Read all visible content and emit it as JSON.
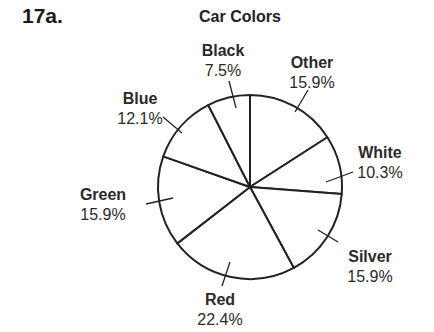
{
  "problem": {
    "number": "17a."
  },
  "chart_data": {
    "type": "pie",
    "title": "Car Colors",
    "start_angle_deg": 0,
    "direction": "clockwise",
    "slices": [
      {
        "label": "Other",
        "value": 15.9,
        "display": "15.9%"
      },
      {
        "label": "White",
        "value": 10.3,
        "display": "10.3%"
      },
      {
        "label": "Silver",
        "value": 15.9,
        "display": "15.9%"
      },
      {
        "label": "Red",
        "value": 22.4,
        "display": "22.4%"
      },
      {
        "label": "Green",
        "value": 15.9,
        "display": "15.9%"
      },
      {
        "label": "Blue",
        "value": 12.1,
        "display": "12.1%"
      },
      {
        "label": "Black",
        "value": 7.5,
        "display": "7.5%"
      }
    ],
    "labels_layout": [
      {
        "x": 312,
        "y": 68,
        "anchor": "middle",
        "tick": [
          [
            308,
            90
          ],
          [
            295,
            112
          ]
        ]
      },
      {
        "x": 380,
        "y": 158,
        "anchor": "middle",
        "tick": [
          [
            353,
            172
          ],
          [
            326,
            182
          ]
        ]
      },
      {
        "x": 370,
        "y": 262,
        "anchor": "middle",
        "tick": [
          [
            338,
            242
          ],
          [
            318,
            230
          ]
        ]
      },
      {
        "x": 220,
        "y": 305,
        "anchor": "middle",
        "tick": [
          [
            222,
            286
          ],
          [
            230,
            262
          ]
        ]
      },
      {
        "x": 103,
        "y": 200,
        "anchor": "middle",
        "tick": [
          [
            146,
            204
          ],
          [
            173,
            198
          ]
        ]
      },
      {
        "x": 140,
        "y": 104,
        "anchor": "middle",
        "tick": [
          [
            163,
            117
          ],
          [
            182,
            133
          ]
        ]
      },
      {
        "x": 223,
        "y": 56,
        "anchor": "middle",
        "tick": [
          [
            229,
            81
          ],
          [
            236,
            108
          ]
        ]
      }
    ],
    "colors": {
      "fill": "#ffffff",
      "stroke": "#222222"
    },
    "center": [
      250,
      187
    ],
    "radius": 92
  }
}
